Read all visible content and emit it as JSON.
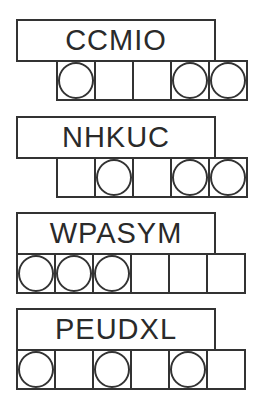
{
  "puzzles": [
    {
      "word": "CCMIO",
      "top": 19,
      "cells_left": 56,
      "cell_count": 5,
      "circled": [
        0,
        3,
        4
      ]
    },
    {
      "word": "NHKUC",
      "top": 116,
      "cells_left": 56,
      "cell_count": 5,
      "circled": [
        1,
        3,
        4
      ]
    },
    {
      "word": "WPASYM",
      "top": 212,
      "cells_left": 16,
      "cell_count": 6,
      "circled": [
        0,
        1,
        2
      ]
    },
    {
      "word": "PEUDXL",
      "top": 308,
      "cells_left": 16,
      "cell_count": 6,
      "circled": [
        0,
        2,
        4
      ]
    }
  ],
  "colors": {
    "stroke": "#333333",
    "text": "#2a2a2a",
    "background": "#ffffff"
  }
}
